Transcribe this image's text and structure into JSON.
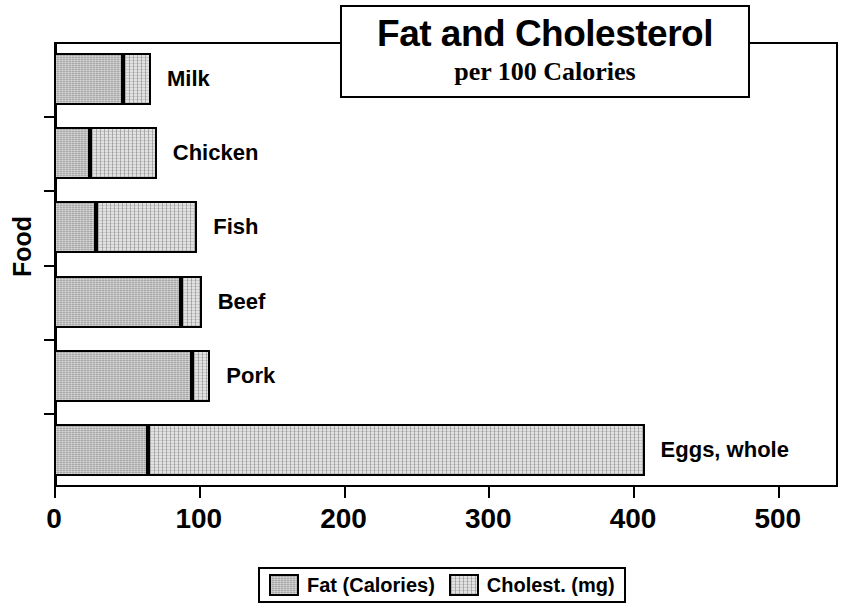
{
  "chart_data": {
    "type": "bar",
    "orientation": "horizontal",
    "stacked": true,
    "title": "Fat and Cholesterol",
    "subtitle": "per 100 Calories",
    "xlabel": "",
    "ylabel": "Food",
    "xlim": [
      0,
      550
    ],
    "ylim": null,
    "grid": false,
    "legend_position": "bottom",
    "xticks": [
      0,
      100,
      200,
      300,
      400,
      500
    ],
    "xtick_labels": [
      "0",
      "100",
      "200",
      "300",
      "400",
      "500"
    ],
    "categories": [
      "Milk",
      "Chicken",
      "Fish",
      "Beef",
      "Pork",
      "Eggs, whole"
    ],
    "series": [
      {
        "name": "Fat (Calories)",
        "color": "#a8a8a8",
        "values": [
          48,
          25,
          29,
          88,
          95,
          65
        ]
      },
      {
        "name": "Cholest. (mg)",
        "color": "#e2e2e2",
        "values": [
          19,
          46,
          70,
          14,
          13,
          343
        ]
      }
    ],
    "totals": [
      67,
      71,
      99,
      102,
      108,
      408
    ]
  },
  "legend": {
    "items": [
      {
        "label": "Fat (Calories)",
        "swatch": "fat-swatch"
      },
      {
        "label": "Cholest. (mg)",
        "swatch": "cholesterol-swatch"
      }
    ]
  },
  "colors": {
    "fat": "#a8a8a8",
    "cholesterol": "#e2e2e2",
    "axis": "#000000",
    "background": "#ffffff"
  }
}
